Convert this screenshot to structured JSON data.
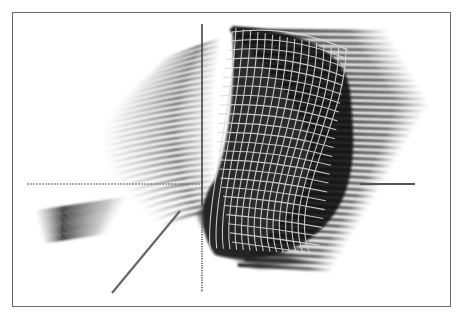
{
  "figure": {
    "frame": {
      "x": 12,
      "y": 12,
      "width": 439,
      "height": 295,
      "border_color": "#6a6a6a"
    }
  },
  "chart_data": {
    "type": "surface",
    "title": "",
    "xlabel": "",
    "ylabel": "",
    "zlabel": "",
    "tick_labels": [],
    "legend": [],
    "grid": false,
    "axes": {
      "vertical": {
        "x": 202,
        "y_top": 24,
        "y_bottom": 292,
        "style_upper": "solid",
        "style_lower": "dotted"
      },
      "horizontal": {
        "y": 184,
        "x_left": 27,
        "x_right": 415,
        "style_left": "dashed",
        "style_right": "solid"
      },
      "diagonal": {
        "x1": 180,
        "y1": 211,
        "x2": 112,
        "y2": 293,
        "style": "solid"
      }
    },
    "colors": {
      "surface": "#111111",
      "mesh": "#d8d8d8",
      "axis": "#555555"
    }
  }
}
